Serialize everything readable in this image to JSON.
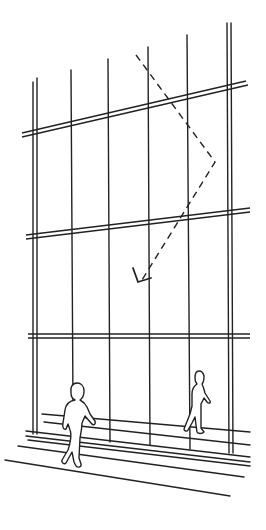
{
  "illustration": {
    "title": "Glass curtain wall facade with pedestrians and reflected sightline",
    "description": "Line drawing of a glazed facade with mullions and transoms, a dashed reflection path ending in an arrowhead, and two walking figures on the sidewalk",
    "colors": {
      "background": "#ffffff",
      "line": "#222222"
    },
    "elements": {
      "mullions_count": 6,
      "transoms_count": 3,
      "figures_count": 2,
      "reflection_path": "dashed line with arrowhead"
    }
  }
}
